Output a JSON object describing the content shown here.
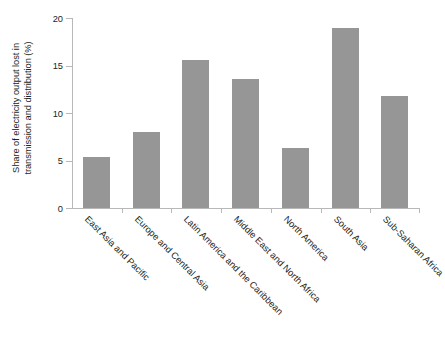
{
  "chart_data": {
    "type": "bar",
    "title": "",
    "subtitle": "",
    "xlabel": "",
    "ylabel": "Share of electricity output lost in transmission and distribution (%)",
    "ylabel_lines": [
      "Share of electricity output lost in",
      "transmission and distribution (%)"
    ],
    "categories": [
      "East Asia and Pacific",
      "Europe and Central Asia",
      "Latin America and the Caribbean",
      "Middle East and North Africa",
      "North America",
      "South Asia",
      "Sub-Saharan Africa"
    ],
    "values": [
      5.4,
      8.0,
      15.6,
      13.6,
      6.3,
      18.9,
      11.8
    ],
    "ylim": [
      0,
      20
    ],
    "yticks": [
      0,
      5,
      10,
      15,
      20
    ],
    "ytick_labels": [
      "0",
      "5",
      "10",
      "15",
      "20"
    ],
    "grid": false,
    "legend": null,
    "legend_position": "none",
    "bar_color": "#969696",
    "axis_color": "#b8b8b8",
    "text_color": "#231f20",
    "background": "#ffffff",
    "xtick_label_rotation": 45
  }
}
